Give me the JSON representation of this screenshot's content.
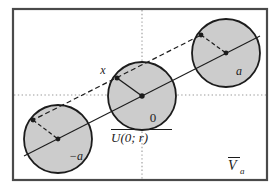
{
  "figure": {
    "canvas": {
      "width": 278,
      "height": 191,
      "background": "#ffffff"
    },
    "frame": {
      "name": "outer-frame",
      "x": 13,
      "y": 9,
      "width": 254,
      "height": 171,
      "stroke": "#4a4a4a",
      "stroke_width": 2.2,
      "fill": "none"
    },
    "axes": {
      "horizontal": {
        "label": "horizontal-axis",
        "y": 95,
        "x1": 13,
        "x2": 267,
        "style": "dotted",
        "color": "#9a9a9a"
      },
      "vertical": {
        "label": "vertical-axis",
        "x": 142,
        "y1": 9,
        "y2": 180,
        "style": "dotted",
        "color": "#9a9a9a"
      }
    },
    "circle_style": {
      "fill": "#cccccc",
      "stroke": "#1c1c1c",
      "stroke_width": 1.8,
      "radius": 34
    },
    "balls": [
      {
        "name": "ball-minus-a",
        "center_label": "-a",
        "center": {
          "x": 58,
          "y": 139
        },
        "radius": 34,
        "center_label_pos": {
          "x": 72,
          "y": 158
        },
        "offset_point": {
          "x": 33,
          "y": 120
        }
      },
      {
        "name": "ball-zero",
        "center_label": "0",
        "center": {
          "x": 142,
          "y": 96
        },
        "radius": 34,
        "center_label_pos": {
          "x": 152,
          "y": 119
        },
        "offset_point": {
          "x": 117,
          "y": 78
        },
        "offset_point_label": "x",
        "offset_point_label_pos": {
          "x": 104,
          "y": 73
        }
      },
      {
        "name": "ball-a",
        "center_label": "a",
        "center": {
          "x": 226,
          "y": 53
        },
        "radius": 34,
        "center_label_pos": {
          "x": 237,
          "y": 73
        },
        "offset_point": {
          "x": 201,
          "y": 35
        }
      }
    ],
    "solid_line": {
      "name": "centers-line",
      "x1": 24,
      "y1": 156,
      "x2": 260,
      "y2": 36,
      "stroke": "#1c1c1c",
      "stroke_width": 1.1
    },
    "dashed_line": {
      "name": "translation-line",
      "x1": 33,
      "y1": 120,
      "x2": 201,
      "y2": 35,
      "stroke": "#1c1c1c",
      "stroke_width": 1.2,
      "dash": "5 3"
    },
    "radius_segments": [
      {
        "name": "radius-segment-minus-a",
        "x1": 33,
        "y1": 120,
        "x2": 58,
        "y2": 139,
        "dash": "4 2.5"
      },
      {
        "name": "radius-segment-zero",
        "x1": 117,
        "y1": 78,
        "x2": 142,
        "y2": 96,
        "dash": "none"
      },
      {
        "name": "radius-segment-a",
        "x1": 201,
        "y1": 35,
        "x2": 226,
        "y2": 53,
        "dash": "4 2.5"
      }
    ],
    "dots": [
      {
        "name": "dot-center-minus-a",
        "x": 58,
        "y": 139,
        "r": 2.4
      },
      {
        "name": "dot-offset-minus-a",
        "x": 33,
        "y": 120,
        "r": 2.4
      },
      {
        "name": "dot-center-zero",
        "x": 142,
        "y": 96,
        "r": 2.6
      },
      {
        "name": "dot-offset-x",
        "x": 117,
        "y": 78,
        "r": 2.4
      },
      {
        "name": "dot-center-a",
        "x": 226,
        "y": 53,
        "r": 2.4
      },
      {
        "name": "dot-offset-a",
        "x": 201,
        "y": 35,
        "r": 2.4
      }
    ],
    "labels": {
      "point_x": "x",
      "point_zero": "0",
      "point_a": "a",
      "point_minus_a": "−a",
      "closed_ball": {
        "symbol": "U",
        "args": "(0; r)",
        "full": "U(0; r)",
        "overline": true
      },
      "region": {
        "symbol": "V",
        "subscript": "a",
        "full": "V",
        "overline": true
      },
      "closed_ball_pos": {
        "x": 112,
        "y": 139
      },
      "region_pos": {
        "x": 228,
        "y": 168
      }
    },
    "colors": {
      "ink": "#1c1c1c",
      "frame": "#4a4a4a",
      "ball_fill": "#cccccc",
      "axis": "#9a9a9a",
      "background": "#ffffff"
    }
  }
}
